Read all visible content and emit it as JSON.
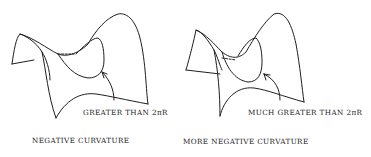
{
  "figures": [
    {
      "annotation": "GREATER THAN 2πR",
      "caption": "NEGATIVE CURVATURE"
    },
    {
      "annotation": "MUCH GREATER THAN 2πR",
      "caption": "MORE NEGATIVE CURVATURE"
    }
  ],
  "colors": {
    "ink": "#1f1f1f",
    "background": "#ffffff"
  }
}
